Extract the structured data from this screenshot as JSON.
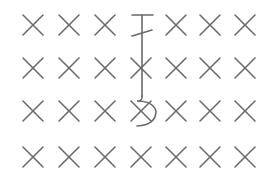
{
  "figure": {
    "width": 276,
    "height": 169,
    "background": "#ffffff",
    "stroke_color": "#6a6a6a",
    "stroke_width": 1.6
  },
  "grid": {
    "columns": [
      33,
      69,
      105,
      141,
      176,
      210,
      245
    ],
    "rows": [
      25,
      68,
      111,
      157
    ],
    "mark_half_size": 10,
    "mark_symbol": "x-mark",
    "omitted_cells": [
      [
        0,
        3
      ]
    ]
  },
  "glyph": {
    "name": "hooked-stem-glyph",
    "top_bar": {
      "x1": 132,
      "x2": 153,
      "y": 15
    },
    "slash": {
      "x1": 132,
      "y1": 36,
      "x2": 152,
      "y2": 30
    },
    "stem": {
      "x": 142,
      "y1": 15,
      "y2": 96
    },
    "hook_path": "M142 96 Q143 101 137 101 Q153 101 156 111 Q156 125 137 126"
  }
}
